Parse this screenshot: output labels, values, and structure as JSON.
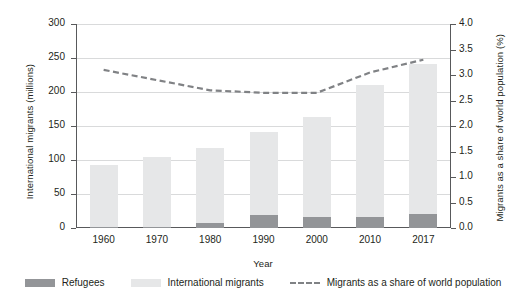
{
  "chart_data": {
    "type": "bar",
    "title": "",
    "subtitle": "",
    "xlabel": "Year",
    "ylabel": "International migrants (millions)",
    "y2label": "Migrants as a share of world population (%)",
    "categories": [
      "1960",
      "1970",
      "1980",
      "1990",
      "2000",
      "2010",
      "2017"
    ],
    "ylim": [
      0,
      300
    ],
    "yticks": [
      "0",
      "50",
      "100",
      "150",
      "200",
      "250",
      "300"
    ],
    "ytick_values": [
      0,
      50,
      100,
      150,
      200,
      250,
      300
    ],
    "y2lim": [
      0,
      4.0
    ],
    "y2ticks": [
      "0.0",
      "0.5",
      "1.0",
      "1.5",
      "2.0",
      "2.5",
      "3.0",
      "3.5",
      "4.0"
    ],
    "y2tick_values": [
      0.0,
      0.5,
      1.0,
      1.5,
      2.0,
      2.5,
      3.0,
      3.5,
      4.0
    ],
    "grid": true,
    "legend_position": "bottom",
    "series": [
      {
        "name": "Refugees",
        "type": "bar",
        "stacked": true,
        "axis": "left",
        "color": "#939598",
        "values": [
          2,
          2,
          8,
          19,
          16,
          16,
          20
        ]
      },
      {
        "name": "International migrants",
        "type": "bar",
        "stacked": true,
        "axis": "left",
        "color": "#e6e7e8",
        "values": [
          93,
          105,
          117,
          141,
          163,
          210,
          241
        ]
      },
      {
        "name": "Migrants as a share of world population",
        "type": "line",
        "style": "dashed",
        "axis": "right",
        "color": "#808285",
        "values": [
          3.1,
          2.9,
          2.7,
          2.65,
          2.65,
          3.05,
          3.3
        ]
      }
    ]
  },
  "legend": {
    "items": [
      {
        "label": "Refugees",
        "marker": "bar-swatch",
        "color": "#939598"
      },
      {
        "label": "International migrants",
        "marker": "bar-swatch",
        "color": "#e6e7e8"
      },
      {
        "label": "Migrants as a share of world population",
        "marker": "dashed-line",
        "color": "#808285"
      }
    ]
  }
}
